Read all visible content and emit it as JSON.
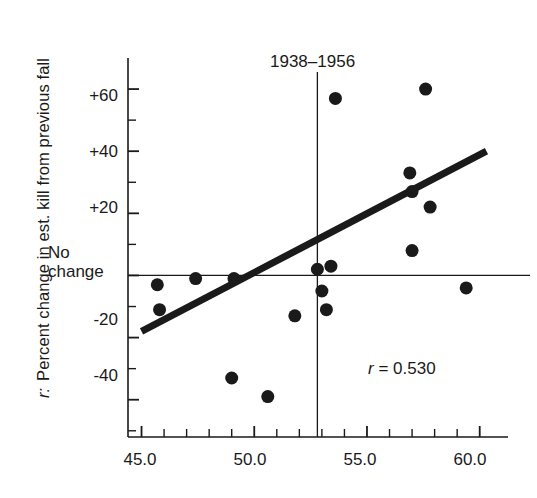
{
  "figure": {
    "width": 537,
    "height": 498,
    "background": "#ffffff",
    "ink_color": "#1a1a1a"
  },
  "axis_title": {
    "y_prefix": "r:",
    "y_text": "Percent change in est. kill from previous fall"
  },
  "chart_data": {
    "type": "scatter",
    "title": "1938–1956",
    "xlabel": "",
    "ylabel": "Percent change in est. kill from previous fall",
    "xlim": [
      44.4,
      60.9
    ],
    "ylim": [
      -52,
      70
    ],
    "grid": false,
    "legend": "none",
    "x_ticks": [
      45.0,
      50.0,
      55.0,
      60.0
    ],
    "x_tick_labels": [
      "45.0",
      "50.0",
      "55.0",
      "60.0"
    ],
    "x_minor_tick_step": 1.0,
    "y_ticks": [
      60,
      40,
      20,
      0,
      -20,
      -40
    ],
    "y_tick_labels": [
      "+60",
      "+40",
      "+20",
      "No change",
      "-20",
      "-40"
    ],
    "y_minor_tick_step": 10,
    "zero_line_label": "No change",
    "points": [
      {
        "x": 45.7,
        "y": -3
      },
      {
        "x": 45.8,
        "y": -11
      },
      {
        "x": 47.4,
        "y": -1
      },
      {
        "x": 49.0,
        "y": -33
      },
      {
        "x": 49.1,
        "y": -1
      },
      {
        "x": 50.6,
        "y": -39
      },
      {
        "x": 51.8,
        "y": -13
      },
      {
        "x": 53.2,
        "y": -11
      },
      {
        "x": 52.8,
        "y": 2
      },
      {
        "x": 53.0,
        "y": -5
      },
      {
        "x": 53.4,
        "y": 3
      },
      {
        "x": 53.6,
        "y": 57
      },
      {
        "x": 56.9,
        "y": 33
      },
      {
        "x": 57.0,
        "y": 27
      },
      {
        "x": 57.0,
        "y": 8
      },
      {
        "x": 57.6,
        "y": 60
      },
      {
        "x": 57.8,
        "y": 22
      },
      {
        "x": 59.4,
        "y": -4
      }
    ],
    "marker": {
      "shape": "circle",
      "color": "#1a1a1a",
      "size_px": 13
    },
    "regression_line": {
      "x1": 45.0,
      "y1": -18,
      "x2": 60.3,
      "y2": 40,
      "color": "#1a1a1a",
      "width_px": 7
    },
    "reference_lines": [
      {
        "orientation": "horizontal",
        "value": 0,
        "label": "No change",
        "width_px": 1.3
      },
      {
        "orientation": "vertical",
        "value": 52.8,
        "label": "1938–1956",
        "width_px": 1.3
      }
    ],
    "annotations": [
      {
        "text": "r = 0.530",
        "r_symbol": "r",
        "equals": "=",
        "value": "0.530",
        "x": 56.5,
        "y": -36
      }
    ],
    "correlation_r": 0.53
  }
}
